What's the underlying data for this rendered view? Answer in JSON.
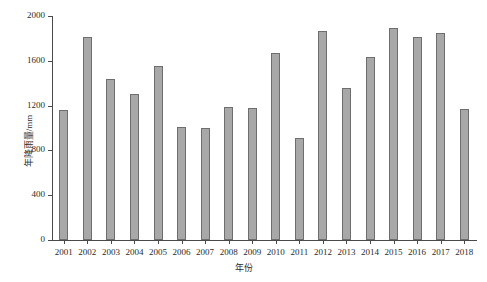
{
  "chart_data": {
    "type": "bar",
    "title": "",
    "xlabel": "年份",
    "ylabel": "年降雨量/mm",
    "categories": [
      "2001",
      "2002",
      "2003",
      "2004",
      "2005",
      "2006",
      "2007",
      "2008",
      "2009",
      "2010",
      "2011",
      "2012",
      "2013",
      "2014",
      "2015",
      "2016",
      "2017",
      "2018"
    ],
    "values": [
      1160,
      1810,
      1440,
      1305,
      1550,
      1010,
      1000,
      1190,
      1180,
      1670,
      910,
      1870,
      1355,
      1630,
      1895,
      1810,
      1845,
      1170
    ],
    "ylim": [
      0,
      2000
    ],
    "yticks": [
      0,
      400,
      800,
      1200,
      1600,
      2000
    ],
    "ytick_labels": [
      "0",
      "400",
      "800",
      "1200",
      "1600",
      "2000"
    ],
    "grid": false,
    "legend": null,
    "series": [
      {
        "name": "年降雨量",
        "values": [
          1160,
          1810,
          1440,
          1305,
          1550,
          1010,
          1000,
          1190,
          1180,
          1670,
          910,
          1870,
          1355,
          1630,
          1895,
          1810,
          1845,
          1170
        ]
      }
    ],
    "colors": {
      "bar_fill": "#a8a8a8",
      "bar_edge": "#6e6e6e",
      "axis": "#4a4a4a",
      "text": "#2b2b2b",
      "background": "#ffffff"
    }
  }
}
